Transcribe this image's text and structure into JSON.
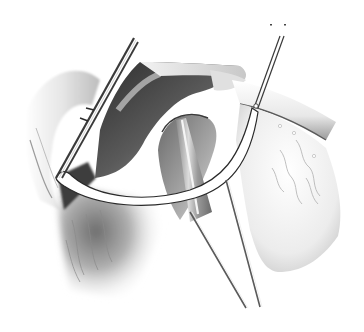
{
  "image": {
    "kind": "surgical-illustration",
    "style": "grayscale pencil/airbrush drawing",
    "width": 364,
    "height": 332,
    "description": "Surgical field showing a retracted tissue flap with a curved white band (suture/retractor), a cone-shaped probe inserted into a cavity, two long thin instruments descending to the bottom, a long needle holder at upper left, and a fine instrument at upper right",
    "colors": {
      "background": "#ffffff",
      "dark_tissue": "#3a3a3a",
      "mid_tissue": "#8a8a8a",
      "light_tissue": "#d8d8d8",
      "band": "#ffffff",
      "outline": "#2a2a2a"
    },
    "elements": [
      {
        "name": "needle-holder-instrument",
        "position": "upper-left diagonal"
      },
      {
        "name": "fine-forceps-instrument",
        "position": "upper-right diagonal"
      },
      {
        "name": "retracted-flap",
        "position": "upper-center"
      },
      {
        "name": "white-curved-band",
        "position": "center arc"
      },
      {
        "name": "cone-probe",
        "position": "center"
      },
      {
        "name": "long-probes",
        "position": "center-bottom"
      },
      {
        "name": "vascular-tissue",
        "position": "right"
      },
      {
        "name": "shaded-tissue",
        "position": "lower-left"
      }
    ]
  }
}
